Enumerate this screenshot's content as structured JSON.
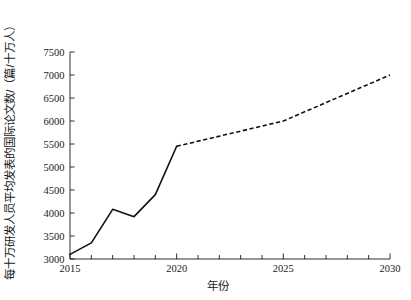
{
  "chart_data": {
    "type": "line",
    "title": "",
    "subtitle": "",
    "xlabel": "年份",
    "ylabel": "每十万研发人员平均发表的国际论文数/（篇/十万人）",
    "xlim": [
      2015,
      2030
    ],
    "ylim": [
      3000,
      7500
    ],
    "grid": false,
    "legend_position": "none",
    "x_ticks_major": [
      2015,
      2020,
      2025,
      2030
    ],
    "x_tick_labels": [
      "2015",
      "2020",
      "2025",
      "2030"
    ],
    "x_ticks_minor_every": 1,
    "y_ticks": [
      3000,
      3500,
      4000,
      4500,
      5000,
      5500,
      6000,
      6500,
      7000,
      7500
    ],
    "y_tick_labels": [
      "3000",
      "3500",
      "4000",
      "4500",
      "5000",
      "5500",
      "6000",
      "6500",
      "7000",
      "7500"
    ],
    "x": [
      2015,
      2016,
      2017,
      2018,
      2019,
      2020,
      2025,
      2030
    ],
    "series": [
      {
        "name": "实测值",
        "style": "solid",
        "color": "#111111",
        "x": [
          2015,
          2016,
          2017,
          2018,
          2019,
          2020
        ],
        "values": [
          3100,
          3350,
          4080,
          3920,
          4400,
          5450
        ]
      },
      {
        "name": "预测值",
        "style": "dashed",
        "color": "#111111",
        "x": [
          2020,
          2025,
          2030
        ],
        "values": [
          5450,
          6000,
          7000
        ]
      }
    ],
    "annotations": []
  }
}
